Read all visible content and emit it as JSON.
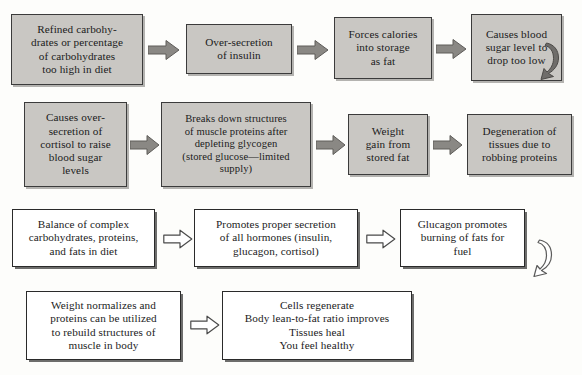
{
  "diagram": {
    "colors": {
      "page_background": "#fdfdfb",
      "gray_box_fill": "#c9c7c3",
      "gray_box_border": "#3b3b3b",
      "white_box_fill": "#ffffff",
      "white_box_border": "#2a2a2a",
      "filled_arrow": "#8a8884",
      "hollow_arrow_fill": "#ffffff",
      "hollow_arrow_stroke": "#4a4a4a",
      "text": "#1b1b1b"
    },
    "rows": [
      {
        "row_id": "row-1",
        "style": "gray",
        "arrow_style": "filled",
        "nodes": [
          {
            "id": "n1",
            "text": "Refined carbohy-\ndrates or percentage\nof carbohydrates\ntoo high in diet"
          },
          {
            "id": "n2",
            "text": "Over-secretion\nof insulin"
          },
          {
            "id": "n3",
            "text": "Forces calories\ninto storage\nas fat"
          },
          {
            "id": "n4",
            "text": "Causes blood\nsugar level to\ndrop too low"
          }
        ],
        "wrap_arrow": true
      },
      {
        "row_id": "row-2",
        "style": "gray",
        "arrow_style": "filled",
        "nodes": [
          {
            "id": "n5",
            "text": "Causes over-\nsecretion of\ncortisol to raise\nblood sugar\nlevels"
          },
          {
            "id": "n6",
            "text": "Breaks down structures\nof muscle proteins after\ndepleting glycogen\n(stored glucose—limited\nsupply)"
          },
          {
            "id": "n7",
            "text": "Weight\ngain from\nstored fat"
          },
          {
            "id": "n8",
            "text": "Degeneration of\ntissues due to\nrobbing proteins"
          }
        ],
        "wrap_arrow": false
      },
      {
        "row_id": "row-3",
        "style": "white",
        "arrow_style": "hollow",
        "nodes": [
          {
            "id": "n9",
            "text": "Balance of complex\ncarbohydrates, proteins,\nand fats in diet"
          },
          {
            "id": "n10",
            "text": "Promotes proper secretion\nof all hormones (insulin,\nglucagon, cortisol)"
          },
          {
            "id": "n11",
            "text": "Glucagon promotes\nburning of fats for\nfuel"
          }
        ],
        "wrap_arrow": true
      },
      {
        "row_id": "row-4",
        "style": "white",
        "arrow_style": "hollow",
        "nodes": [
          {
            "id": "n12",
            "text": "Weight normalizes and\nproteins can be utilized\nto rebuild structures of\nmuscle in body"
          },
          {
            "id": "n13",
            "text": "Cells regenerate\nBody lean-to-fat ratio improves\nTissues heal\nYou feel healthy"
          }
        ],
        "wrap_arrow": false
      }
    ]
  }
}
